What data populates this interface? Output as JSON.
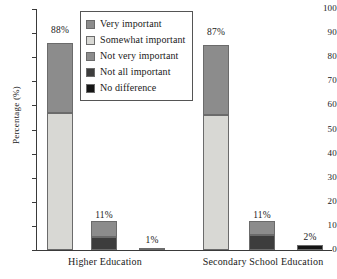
{
  "chart_data": {
    "type": "bar",
    "subtype": "stacked-bar-grouped",
    "title": "",
    "xlabel": "",
    "ylabel": "Percentage (%)",
    "ylim": [
      0,
      100
    ],
    "ytick_step": 10,
    "yticks": [
      "100",
      "90",
      "80",
      "70",
      "60",
      "50",
      "40",
      "30",
      "20",
      "10",
      "0"
    ],
    "grid": false,
    "legend_position": "upper-left-inside",
    "categories": [
      "Higher Education",
      "Secondary School Education"
    ],
    "series": [
      {
        "name": "Very important",
        "color": "#8c8c8c"
      },
      {
        "name": "Somewhat important",
        "color": "#d8d8d4"
      },
      {
        "name": "Not very important",
        "color": "#8c8c8c"
      },
      {
        "name": "Not all important",
        "color": "#3d3d3d"
      },
      {
        "name": "No difference",
        "color": "#151515"
      }
    ],
    "groups": [
      {
        "category": "Higher Education",
        "bars": [
          {
            "label": "88%",
            "total": 88,
            "segments": [
              {
                "series": "Somewhat important",
                "value": 57,
                "color": "#d8d8d4"
              },
              {
                "series": "Very important",
                "value": 29,
                "color": "#8c8c8c"
              }
            ]
          },
          {
            "label": "11%",
            "total": 11,
            "segments": [
              {
                "series": "Not all important",
                "value": 5.5,
                "color": "#3d3d3d"
              },
              {
                "series": "Not very important",
                "value": 6.5,
                "color": "#8c8c8c"
              }
            ]
          },
          {
            "label": "1%",
            "total": 1,
            "segments": [
              {
                "series": "No difference",
                "value": 1,
                "color": "#151515"
              }
            ]
          }
        ]
      },
      {
        "category": "Secondary School Education",
        "bars": [
          {
            "label": "87%",
            "total": 87,
            "segments": [
              {
                "series": "Somewhat important",
                "value": 56,
                "color": "#d8d8d4"
              },
              {
                "series": "Very important",
                "value": 29,
                "color": "#8c8c8c"
              }
            ]
          },
          {
            "label": "11%",
            "total": 11,
            "segments": [
              {
                "series": "Not all important",
                "value": 6.3,
                "color": "#3d3d3d"
              },
              {
                "series": "Not very important",
                "value": 5.7,
                "color": "#8c8c8c"
              }
            ]
          },
          {
            "label": "2%",
            "total": 2,
            "segments": [
              {
                "series": "No difference",
                "value": 2,
                "color": "#151515"
              }
            ]
          }
        ]
      }
    ]
  },
  "legend": {
    "items": [
      {
        "label": "Very important",
        "color": "#8c8c8c"
      },
      {
        "label": "Somewhat important",
        "color": "#d8d8d4"
      },
      {
        "label": "Not very important",
        "color": "#8c8c8c"
      },
      {
        "label": "Not all important",
        "color": "#3d3d3d"
      },
      {
        "label": "No difference",
        "color": "#151515"
      }
    ]
  },
  "axes": {
    "y_title": "Percentage (%)",
    "y_ticks": [
      "100",
      "90",
      "80",
      "70",
      "60",
      "50",
      "40",
      "30",
      "20",
      "10",
      "0"
    ],
    "x_ticks": [
      "Higher Education",
      "Secondary School Education"
    ]
  }
}
